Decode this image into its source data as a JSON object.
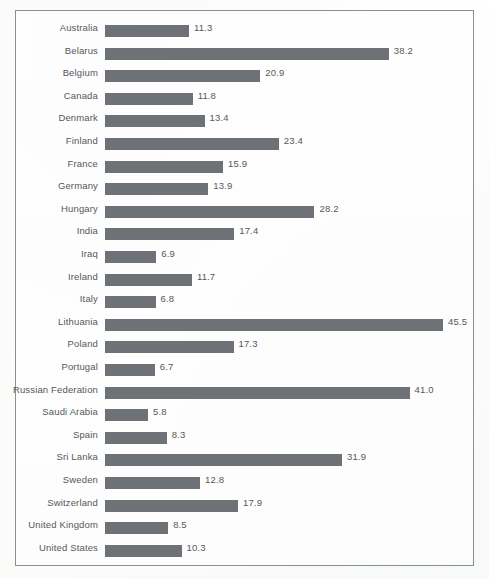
{
  "chart_data": {
    "type": "bar",
    "orientation": "horizontal",
    "title": "",
    "subtitle": "",
    "xlabel": "",
    "ylabel": "",
    "grid": false,
    "legend": null,
    "xlim": [
      0,
      45.5
    ],
    "value_label_format": "one-decimal",
    "categories": [
      "Australia",
      "Belarus",
      "Belgium",
      "Canada",
      "Denmark",
      "Finland",
      "France",
      "Germany",
      "Hungary",
      "India",
      "Iraq",
      "Ireland",
      "Italy",
      "Lithuania",
      "Poland",
      "Portugal",
      "Russian Federation",
      "Saudi Arabia",
      "Spain",
      "Sri Lanka",
      "Sweden",
      "Switzerland",
      "United Kingdom",
      "United States"
    ],
    "values": [
      11.3,
      38.2,
      20.9,
      11.8,
      13.4,
      23.4,
      15.9,
      13.9,
      28.2,
      17.4,
      6.9,
      11.7,
      6.8,
      45.5,
      17.3,
      6.7,
      41.0,
      5.8,
      8.3,
      31.9,
      12.8,
      17.9,
      8.5,
      10.3
    ],
    "value_labels": [
      "11.3",
      "38.2",
      "20.9",
      "11.8",
      "13.4",
      "23.4",
      "15.9",
      "13.9",
      "28.2",
      "17.4",
      "6.9",
      "11.7",
      "6.8",
      "45.5",
      "17.3",
      "6.7",
      "41.0",
      "5.8",
      "8.3",
      "31.9",
      "12.8",
      "17.9",
      "8.5",
      "10.3"
    ],
    "colors": {
      "bar_fill": "#6e7175",
      "text": "#55585c",
      "frame_border": "#8b8f93",
      "background": "#fdfdfc"
    }
  }
}
